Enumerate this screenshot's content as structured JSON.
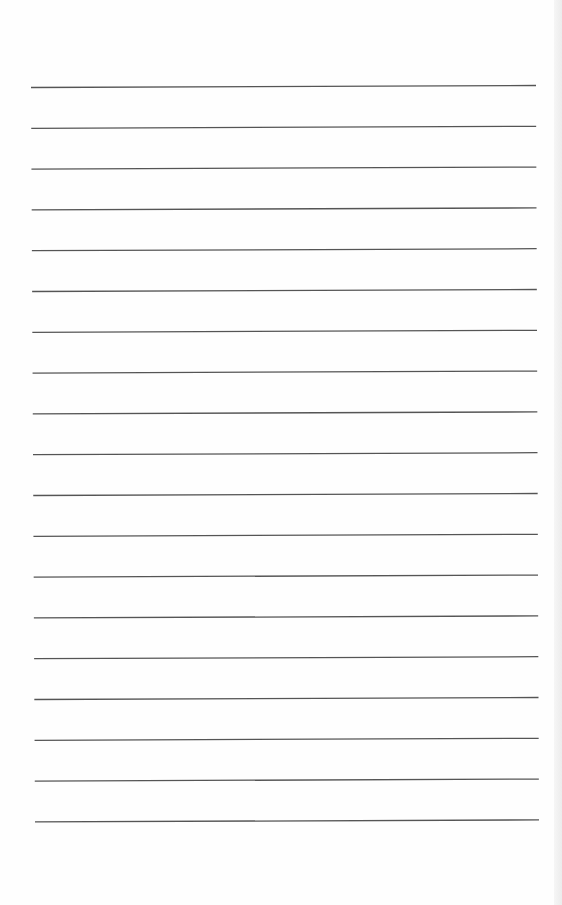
{
  "page": {
    "type": "ruled-paper",
    "line_count": 19,
    "line_color": "#555555",
    "background": "#fefefe",
    "lines": {
      "first_y_left": 87.5,
      "first_y_right": 85.5,
      "spacing": 40.8,
      "x_start_top": 31,
      "x_end_top": 536,
      "x_start_bottom": 35,
      "x_end_bottom": 539
    }
  }
}
